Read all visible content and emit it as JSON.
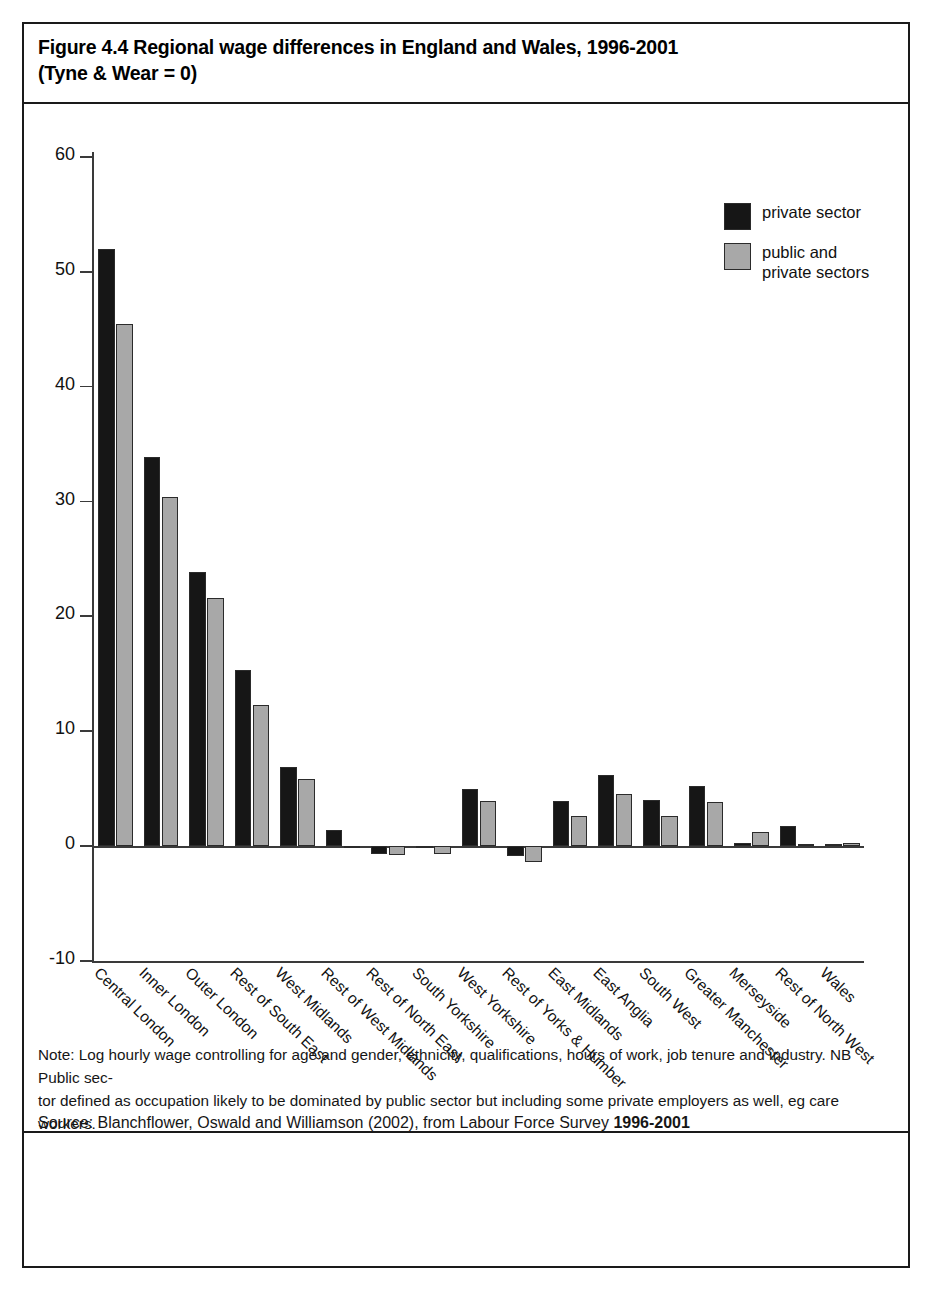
{
  "figure": {
    "title_line1": "Figure 4.4 Regional wage differences in England and Wales, 1996-2001",
    "title_line2": "(Tyne & Wear = 0)"
  },
  "legend": {
    "position": "top-right",
    "items": [
      {
        "label_line1": "private sector",
        "label_line2": "",
        "color": "#161616"
      },
      {
        "label_line1": "public and",
        "label_line2": "private sectors",
        "color": "#a8a8a8"
      }
    ]
  },
  "footer": {
    "note_line1": "Note: Log hourly wage controlling for age and gender, ethnicity, qualifications, hours of work, job tenure and industry. NB Public sec-",
    "note_line2": "tor defined as occupation likely to be dominated by public sector but including some private employers as well, eg care workers.",
    "source_prefix": "Source: Blanchflower, Oswald and Williamson (2002), from ",
    "source_dataset": "Labour Force Survey ",
    "source_years": "1996-2001"
  },
  "chart_data": {
    "type": "bar",
    "title": "Figure 4.4 Regional wage differences in England and Wales, 1996-2001 (Tyne & Wear = 0)",
    "subtitle": "",
    "xlabel": "",
    "ylabel": "",
    "ylim": [
      -10,
      60
    ],
    "yticks": [
      60,
      50,
      40,
      30,
      20,
      10,
      0,
      -10
    ],
    "ytick_labels": [
      "60",
      "50",
      "40",
      "30",
      "20",
      "10",
      "0",
      "-10"
    ],
    "grid": false,
    "legend_position": "top-right",
    "categories": [
      "Central London",
      "Inner London",
      "Outer London",
      "Rest of South East",
      "West Midlands",
      "Rest of West Midlands",
      "Rest of North East",
      "South Yorkshire",
      "West Yorkshire",
      "Rest of Yorks & Humber",
      "East Midlands",
      "East Anglia",
      "South West",
      "Greater Manchester",
      "Merseyside",
      "Rest of North West",
      "Wales"
    ],
    "series": [
      {
        "name": "private sector",
        "color": "#161616",
        "values": [
          52.0,
          33.9,
          23.9,
          15.3,
          6.9,
          1.4,
          -0.7,
          -0.2,
          5.0,
          -0.9,
          3.9,
          6.2,
          4.0,
          5.2,
          0.3,
          1.7,
          0.2
        ]
      },
      {
        "name": "public and private sectors",
        "color": "#a8a8a8",
        "values": [
          45.5,
          30.4,
          21.6,
          12.3,
          5.8,
          0.0,
          -0.8,
          -0.7,
          3.9,
          -1.4,
          2.6,
          4.5,
          2.6,
          3.8,
          1.2,
          0.2,
          0.3
        ]
      }
    ]
  }
}
